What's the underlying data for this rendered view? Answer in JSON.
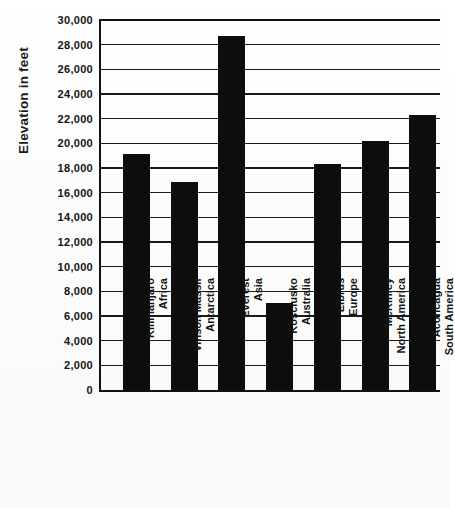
{
  "chart_data": {
    "type": "bar",
    "title": "",
    "xlabel": "",
    "ylabel": "Elevation in feet",
    "ylim": [
      0,
      30000
    ],
    "ytick_step": 2000,
    "grid": true,
    "legend": "none",
    "orientation": "vertical",
    "bar_color": "#0d0d0d",
    "background_color": "#fdfdfb",
    "categories": [
      "Kilimanjaro Africa",
      "Vinson Massif Antarctica",
      "Everest Asia",
      "Kosciusko Australia",
      "Elbrus Europe",
      "McKinley North America",
      "Aconcagua South America"
    ],
    "category_lines": [
      {
        "line1": "Kilimanjaro",
        "line2": "Africa"
      },
      {
        "line1": "Vinson Massif",
        "line2": "Antarctica"
      },
      {
        "line1": "Everest",
        "line2": "Asia"
      },
      {
        "line1": "Kosciusko",
        "line2": "Australia"
      },
      {
        "line1": "Elbrus",
        "line2": "Europe"
      },
      {
        "line1": "McKinley",
        "line2": "North America"
      },
      {
        "line1": "Aconcagua",
        "line2": "South America"
      }
    ],
    "values": [
      19100,
      16850,
      28700,
      7050,
      18300,
      20200,
      22300
    ],
    "ytick_labels": [
      "0",
      "2,000",
      "4,000",
      "6,000",
      "8,000",
      "10,000",
      "12,000",
      "14,000",
      "16,000",
      "18,000",
      "20,000",
      "22,000",
      "24,000",
      "26,000",
      "28,000",
      "30,000"
    ],
    "ytick_values": [
      0,
      2000,
      4000,
      6000,
      8000,
      10000,
      12000,
      14000,
      16000,
      18000,
      20000,
      22000,
      24000,
      26000,
      28000,
      30000
    ]
  }
}
